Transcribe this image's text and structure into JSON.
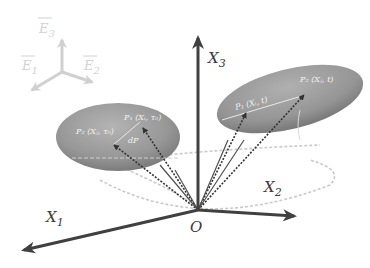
{
  "reference_frame": {
    "e1": {
      "base": "E",
      "sub": "1"
    },
    "e2": {
      "base": "E",
      "sub": "2"
    },
    "e3": {
      "base": "E",
      "sub": "3"
    }
  },
  "axes": {
    "x1": {
      "base": "X",
      "sub": "1"
    },
    "x2": {
      "base": "X",
      "sub": "2"
    },
    "x3": {
      "base": "X",
      "sub": "3"
    },
    "origin": "O"
  },
  "left_body": {
    "p1": "P₁ (Xᵢ, τ₀)",
    "p2": "P₂ (Xⱼ, τ₀)",
    "dp": "dP"
  },
  "right_body": {
    "p1": "P₁ (Xᵢ, t)",
    "p2": "P₂ (Xⱼ, t)"
  },
  "colors": {
    "axis": "#404040",
    "body": "#8c8c8c",
    "ref_frame": "#d0d0d0",
    "dashed": "#c8c8c8"
  }
}
